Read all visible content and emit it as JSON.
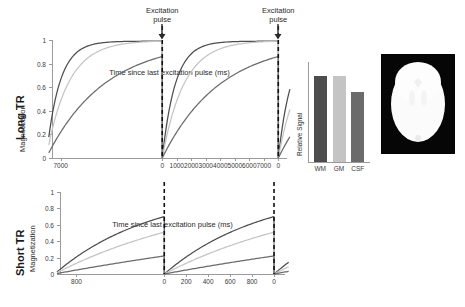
{
  "figure": {
    "rows": [
      {
        "id": "long-tr",
        "row_label": "Long TR",
        "plot": {
          "ylabel": "Magnetization",
          "xlabel": "Time since last excitation pulse (ms)",
          "yticks": [
            "0",
            "0.2",
            "0.4",
            "0.6",
            "0.8",
            "1"
          ],
          "xticks": [
            "7000",
            "0",
            "1000",
            "2000",
            "3000",
            "4000",
            "5000",
            "6000",
            "7000",
            "0",
            "1000"
          ],
          "annotations": [
            {
              "line1": "Excitation",
              "line2": "pulse"
            },
            {
              "line1": "Excitation",
              "line2": "pulse"
            }
          ]
        },
        "bars": {
          "ylabel": "Relative Signal",
          "categories": [
            "WM",
            "GM",
            "CSF"
          ],
          "values": [
            0.86,
            0.86,
            0.7
          ],
          "colors": [
            "#4d4d4d",
            "#c4c4c4",
            "#6b6b6b"
          ]
        },
        "brain_contrast": "low"
      },
      {
        "id": "short-tr",
        "row_label": "Short TR",
        "plot": {
          "ylabel": "Magnetization",
          "xlabel": "Time since last excitation pulse (ms)",
          "yticks": [
            "0",
            "0.2",
            "0.4",
            "0.6",
            "0.8",
            "1"
          ],
          "xticks": [
            "800",
            "0",
            "200",
            "400",
            "600",
            "800",
            "0",
            "200"
          ],
          "annotations": [
            {
              "line1": "",
              "line2": ""
            },
            {
              "line1": "",
              "line2": ""
            }
          ]
        },
        "bars": {
          "ylabel": "Relative Signal",
          "categories": [
            "WM",
            "GM",
            "CSF"
          ],
          "values": [
            0.7,
            0.51,
            0.22
          ],
          "colors": [
            "#4d4d4d",
            "#c4c4c4",
            "#6b6b6b"
          ]
        },
        "brain_contrast": "high"
      }
    ]
  },
  "chart_data": [
    {
      "type": "line",
      "id": "long-tr-recovery",
      "title": "Long TR longitudinal magnetization recovery",
      "xlabel": "Time since last excitation pulse (ms)",
      "ylabel": "Magnetization",
      "xlim": [
        -7600,
        8600
      ],
      "ylim": [
        0,
        1.0
      ],
      "xticks": [
        -7000,
        0,
        1000,
        2000,
        3000,
        4000,
        5000,
        6000,
        7000,
        8000,
        9000
      ],
      "xticklabels": [
        "7000",
        "0",
        "1000",
        "2000",
        "3000",
        "4000",
        "5000",
        "6000",
        "7000",
        "0",
        "1000"
      ],
      "yticks": [
        0,
        0.2,
        0.4,
        0.6,
        0.8,
        1
      ],
      "grid": false,
      "legend": null,
      "tr_ms": 8000,
      "annotations": [
        {
          "text": "Excitation pulse",
          "x": 0,
          "type": "arrow-down"
        },
        {
          "text": "Excitation pulse",
          "x": 8000,
          "type": "arrow-down"
        }
      ],
      "series": [
        {
          "name": "WM",
          "t1_ms": 900,
          "color": "#4d4d4d",
          "plateau": 1.0,
          "value_at_tr": 0.99
        },
        {
          "name": "GM",
          "t1_ms": 1500,
          "color": "#c4c4c4",
          "plateau": 1.0,
          "value_at_tr": 0.99
        },
        {
          "name": "CSF",
          "t1_ms": 4000,
          "color": "#6b6b6b",
          "plateau": 0.87,
          "value_at_tr": 0.86
        }
      ]
    },
    {
      "type": "bar",
      "id": "long-tr-signal",
      "title": "Relative Signal (Long TR)",
      "xlabel": "",
      "ylabel": "Relative Signal",
      "categories": [
        "WM",
        "GM",
        "CSF"
      ],
      "values": [
        0.86,
        0.86,
        0.7
      ],
      "colors": [
        "#4d4d4d",
        "#c4c4c4",
        "#6b6b6b"
      ],
      "ylim": [
        0,
        1.0
      ],
      "grid": false
    },
    {
      "type": "line",
      "id": "short-tr-recovery",
      "title": "Short TR longitudinal magnetization recovery",
      "xlabel": "Time since last excitation pulse (ms)",
      "ylabel": "Magnetization",
      "xlim": [
        -950,
        1100
      ],
      "ylim": [
        0,
        1.0
      ],
      "xticks": [
        -800,
        0,
        200,
        400,
        600,
        800,
        1000,
        1200
      ],
      "xticklabels": [
        "800",
        "0",
        "200",
        "400",
        "600",
        "800",
        "0",
        "200"
      ],
      "yticks": [
        0,
        0.2,
        0.4,
        0.6,
        0.8,
        1
      ],
      "grid": false,
      "legend": null,
      "tr_ms": 1000,
      "annotations": [
        {
          "text": "",
          "x": 0,
          "type": "dashed-line"
        },
        {
          "text": "",
          "x": 1000,
          "type": "dashed-line"
        }
      ],
      "series": [
        {
          "name": "WM",
          "t1_ms": 900,
          "color": "#4d4d4d",
          "plateau": 0.7,
          "value_at_tr": 0.7
        },
        {
          "name": "GM",
          "t1_ms": 1500,
          "color": "#c4c4c4",
          "plateau": 0.51,
          "value_at_tr": 0.51
        },
        {
          "name": "CSF",
          "t1_ms": 4000,
          "color": "#6b6b6b",
          "plateau": 0.22,
          "value_at_tr": 0.22
        }
      ]
    },
    {
      "type": "bar",
      "id": "short-tr-signal",
      "title": "Relative Signal (Short TR)",
      "xlabel": "",
      "ylabel": "Relative Signal",
      "categories": [
        "WM",
        "GM",
        "CSF"
      ],
      "values": [
        0.7,
        0.51,
        0.22
      ],
      "colors": [
        "#4d4d4d",
        "#c4c4c4",
        "#6b6b6b"
      ],
      "ylim": [
        0,
        1.0
      ],
      "grid": false
    }
  ]
}
